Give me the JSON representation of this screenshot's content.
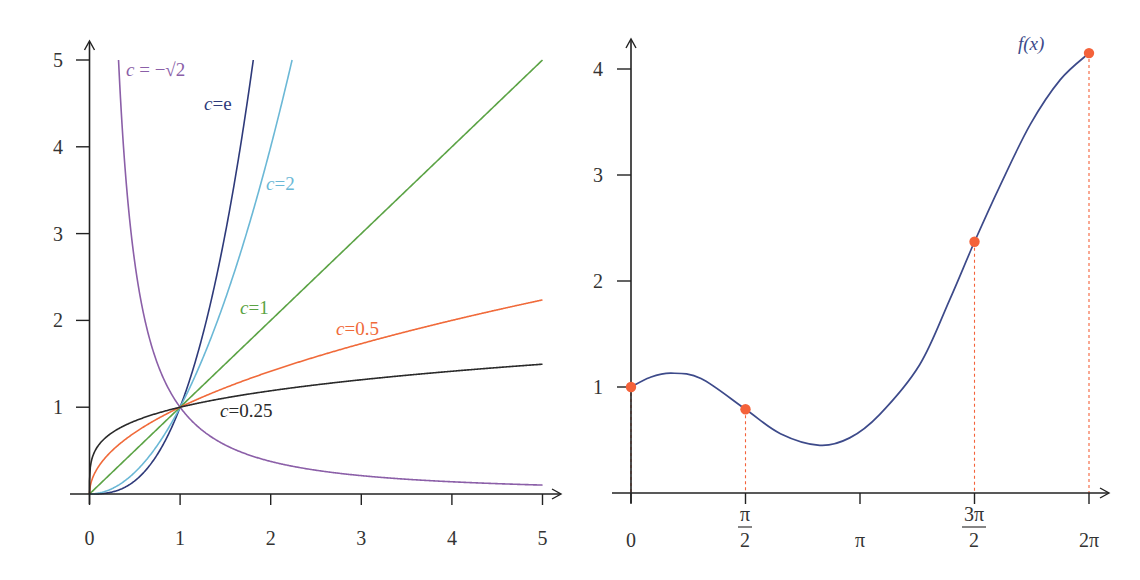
{
  "chart_data": [
    {
      "type": "line",
      "title": "",
      "description": "Power functions y = x^c for several values of c",
      "xlabel": "",
      "ylabel": "",
      "xlim": [
        0,
        5
      ],
      "ylim": [
        0,
        5
      ],
      "grid": false,
      "x_ticks": [
        "0",
        "1",
        "2",
        "3",
        "4",
        "5"
      ],
      "y_ticks": [
        "1",
        "2",
        "3",
        "4",
        "5"
      ],
      "series": [
        {
          "name": "c = −√2",
          "exponent": -1.41421,
          "color": "#8B5FA8",
          "label": {
            "prefix": "c",
            "text": " = −√2",
            "x": 126,
            "y": 76
          }
        },
        {
          "name": "c=e",
          "exponent": 2.71828,
          "color": "#2E3A7A",
          "label": {
            "prefix": "c",
            "text": "=e",
            "x": 204,
            "y": 110
          }
        },
        {
          "name": "c=2",
          "exponent": 2,
          "color": "#6BB8D6",
          "label": {
            "prefix": "c",
            "text": "=2",
            "x": 266,
            "y": 190
          }
        },
        {
          "name": "c=1",
          "exponent": 1,
          "color": "#5BA345",
          "label": {
            "prefix": "c",
            "text": "=1",
            "x": 240,
            "y": 314
          }
        },
        {
          "name": "c=0.5",
          "exponent": 0.5,
          "color": "#F06A3A",
          "label": {
            "prefix": "c",
            "text": "=0.5",
            "x": 336,
            "y": 335
          }
        },
        {
          "name": "c=0.25",
          "exponent": 0.25,
          "color": "#2a2a2a",
          "label": {
            "prefix": "c",
            "text": "=0.25",
            "x": 220,
            "y": 417
          }
        }
      ],
      "intersection_point": [
        1,
        1
      ]
    },
    {
      "type": "line",
      "title": "",
      "xlabel": "",
      "ylabel": "",
      "xlim": [
        0,
        6.2832
      ],
      "ylim": [
        0,
        4.2
      ],
      "grid": false,
      "x_ticks": [
        "0",
        "π/2",
        "π",
        "3π/2",
        "2π"
      ],
      "y_ticks": [
        "1",
        "2",
        "3",
        "4"
      ],
      "series": [
        {
          "name": "f(x)",
          "color": "#3D4A8A",
          "x": [
            0,
            0.26,
            0.55,
            0.96,
            1.5708,
            2.05,
            2.59,
            3.0,
            3.41,
            3.96,
            4.37,
            4.7124,
            5.07,
            5.48,
            5.89,
            6.2832
          ],
          "y": [
            1.0,
            1.09,
            1.13,
            1.08,
            0.79,
            0.56,
            0.45,
            0.52,
            0.74,
            1.21,
            1.82,
            2.37,
            2.91,
            3.48,
            3.9,
            4.15
          ]
        }
      ],
      "marked_points": [
        {
          "x": 0,
          "x_label": "0",
          "y": 1.0
        },
        {
          "x": 1.5708,
          "x_label": "π/2",
          "y": 0.79
        },
        {
          "x": 4.7124,
          "x_label": "3π/2",
          "y": 2.37
        },
        {
          "x": 6.2832,
          "x_label": "2π",
          "y": 4.15
        }
      ],
      "marker_color": "#F4623A",
      "series_label": "f(x)"
    }
  ],
  "left_chart": {
    "x_ticks": [
      "0",
      "1",
      "2",
      "3",
      "4",
      "5"
    ],
    "y_ticks": [
      "1",
      "2",
      "3",
      "4",
      "5"
    ]
  },
  "right_chart": {
    "x_ticks": {
      "zero": "0",
      "half_pi_num": "π",
      "half_pi_den": "2",
      "pi": "π",
      "three_half_pi_num": "3π",
      "three_half_pi_den": "2",
      "two_pi": "2π"
    },
    "y_ticks": [
      "1",
      "2",
      "3",
      "4"
    ],
    "curve_label_f": "f",
    "curve_label_x": "(x)"
  }
}
